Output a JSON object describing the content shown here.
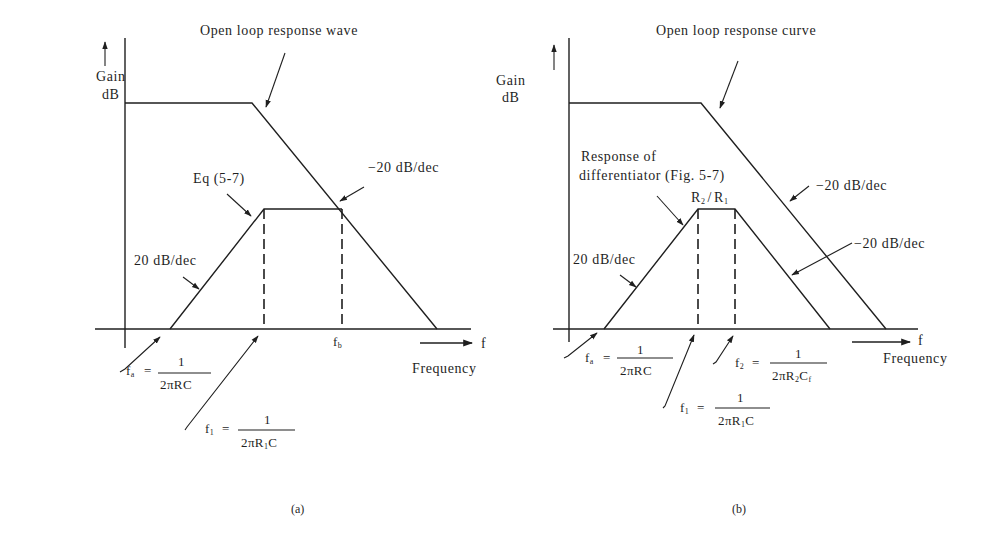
{
  "figure": {
    "panels": [
      {
        "id": "a",
        "caption": "(a)",
        "y_axis_label": [
          "Gain",
          "dB"
        ],
        "x_axis_symbol": "f",
        "x_axis_label": "Frequency",
        "open_loop_label": "Open loop response wave",
        "eq_label": "Eq (5-7)",
        "rise_slope_label": "20 dB/dec",
        "fall_slope_label": "−20 dB/dec",
        "fb_label": "f",
        "fb_sub": "b",
        "fa": {
          "sym": "f",
          "sub": "a",
          "eq": "=",
          "num": "1",
          "den": "2πRC"
        },
        "f1": {
          "sym": "f",
          "sub": "1",
          "eq": "=",
          "num": "1",
          "den_pre": "2πR",
          "den_sub": "1",
          "den_post": "C"
        }
      },
      {
        "id": "b",
        "caption": "(b)",
        "y_axis_label": [
          "Gain",
          "dB"
        ],
        "x_axis_symbol": "f",
        "x_axis_label": "Frequency",
        "open_loop_label": "Open loop response curve",
        "diff_label": [
          "Response of",
          "differentiator (Fig. 5-7)"
        ],
        "gain_label": {
          "a": "R",
          "a_sub": "2",
          "sep": "/",
          "b": "R",
          "b_sub": "1"
        },
        "rise_slope_label": "20 dB/dec",
        "fall_slope_label_1": "−20 dB/dec",
        "fall_slope_label_2": "−20 dB/dec",
        "fa": {
          "sym": "f",
          "sub": "a",
          "eq": "=",
          "num": "1",
          "den": "2πRC"
        },
        "f1": {
          "sym": "f",
          "sub": "1",
          "eq": "=",
          "num": "1",
          "den_pre": "2πR",
          "den_sub": "1",
          "den_post": "C"
        },
        "f2": {
          "sym": "f",
          "sub": "2",
          "eq": "=",
          "num": "1",
          "den_pre": "2πR",
          "den_sub": "2",
          "den_mid": "C",
          "den_sub2": "f"
        }
      }
    ]
  }
}
